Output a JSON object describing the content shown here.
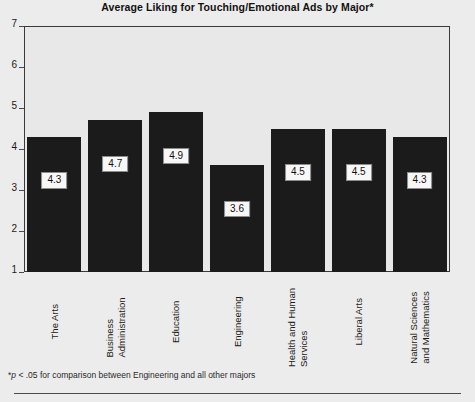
{
  "chart_data": {
    "type": "bar",
    "title": "Average Liking for Touching/Emotional Ads by Major*",
    "xlabel": "",
    "ylabel": "",
    "ylim": [
      1,
      7
    ],
    "yticks": [
      1,
      2,
      3,
      4,
      5,
      6,
      7
    ],
    "grid": false,
    "legend": "none",
    "bar_color": "#1b1b1b",
    "categories": [
      "The Arts",
      "Business\nAdministration",
      "Education",
      "Engineering",
      "Health and Human\nServices",
      "Liberal Arts",
      "Natural Sciences\nand Mathematics"
    ],
    "values": [
      4.3,
      4.7,
      4.9,
      3.6,
      4.5,
      4.5,
      4.3
    ],
    "value_labels": [
      "4.3",
      "4.7",
      "4.9",
      "3.6",
      "4.5",
      "4.5",
      "4.3"
    ],
    "annotations": [
      {
        "name": "significance-footnote",
        "italic_part": "p",
        "text_before": "*",
        "text_after": " < .05 for comparison between Engineering and all other majors",
        "full_text": "*p < .05 for comparison between Engineering and all other majors"
      }
    ]
  },
  "footnote": {
    "star": "*",
    "italic": "p",
    "rest": " < .05 for comparison between Engineering and all other majors"
  }
}
